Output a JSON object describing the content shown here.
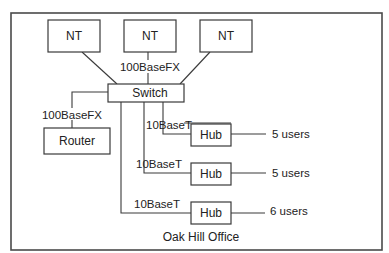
{
  "diagram": {
    "title": "Oak Hill Office",
    "nodes": {
      "nt1": "NT",
      "nt2": "NT",
      "nt3": "NT",
      "switch": "Switch",
      "router": "Router",
      "hub1": "Hub",
      "hub2": "Hub",
      "hub3": "Hub"
    },
    "links": {
      "nt_to_switch": "100BaseFX",
      "switch_to_router": "100BaseFX",
      "switch_to_hub1": "10BaseT",
      "switch_to_hub2": "10BaseT",
      "switch_to_hub3": "10BaseT"
    },
    "users": {
      "hub1": "5 users",
      "hub2": "5 users",
      "hub3": "6 users"
    },
    "colors": {
      "stroke": "#3a3a3a",
      "text": "#222222",
      "background": "#ffffff"
    }
  }
}
